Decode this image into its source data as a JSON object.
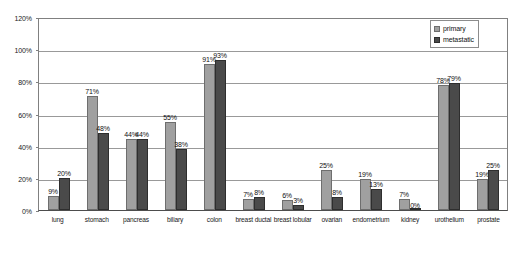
{
  "chart_data": {
    "type": "bar",
    "title": "",
    "subtitle": "",
    "xlabel": "",
    "ylabel": "",
    "ylim": [
      0,
      120
    ],
    "y_tick_labels": [
      "0%",
      "20%",
      "40%",
      "60%",
      "80%",
      "100%",
      "120%"
    ],
    "y_ticks": [
      0,
      20,
      40,
      60,
      80,
      100,
      120
    ],
    "grid": "horizontal",
    "legend_position": "top-right",
    "categories": [
      "lung",
      "stomach",
      "pancreas",
      "biliary",
      "colon",
      "breast ductal",
      "breast lobular",
      "ovarian",
      "endometrium",
      "kidney",
      "urothelium",
      "prostate"
    ],
    "series": [
      {
        "name": "primary",
        "color": "#a0a0a0",
        "values": [
          9,
          71,
          44,
          55,
          91,
          7,
          6,
          25,
          19,
          7,
          78,
          19
        ],
        "labels": [
          "9%",
          "71%",
          "44%",
          "55%",
          "91%",
          "7%",
          "6%",
          "25%",
          "19%",
          "7%",
          "78%",
          "19%"
        ]
      },
      {
        "name": "metastatic",
        "color": "#4a4a4a",
        "values": [
          20,
          48,
          44,
          38,
          93,
          8,
          3,
          8,
          13,
          0,
          79,
          25
        ],
        "labels": [
          "20%",
          "48%",
          "44%",
          "38%",
          "93%",
          "8%",
          "3%",
          "8%",
          "13%",
          "0%",
          "79%",
          "25%"
        ]
      }
    ]
  },
  "legend": {
    "entries": [
      {
        "label": "primary"
      },
      {
        "label": "metastatic"
      }
    ]
  }
}
